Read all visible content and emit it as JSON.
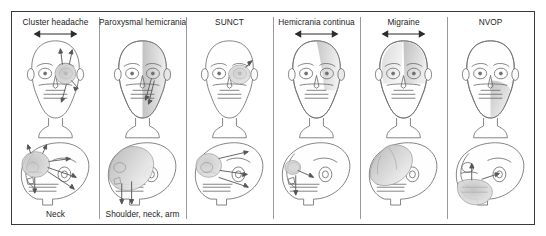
{
  "figure": {
    "frame_color": "#3a3a3a",
    "background": "#ffffff",
    "divider_color": "#9a9a9a",
    "shade_color": "#c9c9c9",
    "line_color": "#6e6e6e",
    "arrow_color": "#2b2b2b",
    "panel_count": 6
  },
  "panels": [
    {
      "title": "Cluster headache",
      "footer": "Neck",
      "has_span_arrow": true,
      "front_view": {
        "icon": "frontal-skull-face",
        "pain_region": "periorbital-left-eye",
        "pain_shape": "circle",
        "radiating_arrows": 4
      },
      "side_view": {
        "icon": "lateral-skull-profile",
        "pain_region": "orbital-frontal",
        "radiating_arrows": 6
      }
    },
    {
      "title": "Paroxysmal hemicrania",
      "footer": "Shoulder, neck, arm",
      "has_span_arrow": false,
      "front_view": {
        "icon": "frontal-skull-face",
        "pain_region": "hemiface-unilateral",
        "pain_shape": "half-face-gradient",
        "radiating_arrows": 2
      },
      "side_view": {
        "icon": "lateral-skull-profile",
        "pain_region": "fronto-temporal-large",
        "radiating_arrows": 2
      }
    },
    {
      "title": "SUNCT",
      "footer": "",
      "has_span_arrow": false,
      "front_view": {
        "icon": "frontal-skull-face",
        "pain_region": "periorbital-localized",
        "pain_shape": "oval",
        "radiating_arrows": 1
      },
      "side_view": {
        "icon": "lateral-skull-profile",
        "pain_region": "orbital",
        "radiating_arrows": 3
      }
    },
    {
      "title": "Hemicrania continua",
      "footer": "",
      "has_span_arrow": true,
      "front_view": {
        "icon": "frontal-skull-face",
        "pain_region": "hemicranial-half-head",
        "pain_shape": "half-head-gradient",
        "radiating_arrows": 0
      },
      "side_view": {
        "icon": "lateral-skull-profile",
        "pain_region": "orbital-maxillary",
        "radiating_arrows": 2
      }
    },
    {
      "title": "Migraine",
      "footer": "",
      "has_span_arrow": true,
      "front_view": {
        "icon": "frontal-skull-face",
        "pain_region": "frontal-temporal-upper-half",
        "pain_shape": "upper-half-gradient",
        "radiating_arrows": 0
      },
      "side_view": {
        "icon": "lateral-skull-profile",
        "pain_region": "fronto-parietal-large",
        "radiating_arrows": 0
      }
    },
    {
      "title": "NVOP",
      "footer": "",
      "has_span_arrow": false,
      "front_view": {
        "icon": "frontal-skull-face",
        "pain_region": "mandibular-maxillary-cheek",
        "pain_shape": "lower-face-gradient",
        "radiating_arrows": 0
      },
      "side_view": {
        "icon": "lateral-skull-profile",
        "pain_region": "mandible-jaw",
        "radiating_arrows": 2
      }
    }
  ]
}
